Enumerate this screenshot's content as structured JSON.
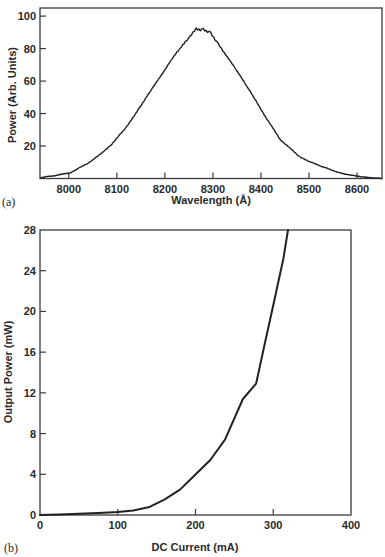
{
  "chart_data": [
    {
      "panel": "(a)",
      "type": "line",
      "title": "",
      "xlabel": "Wavelength (Å)",
      "ylabel": "Power (Arb. Units)",
      "xlim": [
        7940,
        8652
      ],
      "ylim": [
        0,
        105
      ],
      "x_ticks": [
        8000,
        8100,
        8200,
        8300,
        8400,
        8500,
        8600
      ],
      "y_ticks": [
        20,
        40,
        60,
        80,
        100
      ],
      "grid": false,
      "legend": null,
      "series": [
        {
          "name": "Emission spectrum",
          "x": [
            7940,
            7970,
            8002,
            8044,
            8086,
            8121,
            8148,
            8175,
            8200,
            8225,
            8252,
            8265,
            8280,
            8295,
            8311,
            8346,
            8377,
            8403,
            8440,
            8482,
            8523,
            8565,
            8607,
            8638,
            8652
          ],
          "y": [
            0.5,
            1.8,
            3.4,
            10,
            20,
            32,
            44,
            56,
            67,
            78,
            87,
            92,
            92,
            90,
            83,
            68,
            54,
            41,
            24,
            13,
            7.7,
            3.4,
            1,
            0.3,
            0
          ]
        }
      ]
    },
    {
      "panel": "(b)",
      "type": "line",
      "title": "",
      "xlabel": "DC Current (mA)",
      "ylabel": "Output Power (mW)",
      "xlim": [
        0,
        400
      ],
      "ylim": [
        0,
        28
      ],
      "x_ticks": [
        0,
        100,
        200,
        300,
        400
      ],
      "y_ticks": [
        0,
        4,
        8,
        12,
        16,
        20,
        24,
        28
      ],
      "grid": false,
      "legend": null,
      "series": [
        {
          "name": "L-I curve",
          "x": [
            0,
            25,
            50,
            75,
            100,
            120,
            141,
            160,
            180,
            199,
            219,
            238,
            261,
            278,
            289,
            302,
            313,
            319
          ],
          "y": [
            0,
            0.05,
            0.12,
            0.2,
            0.3,
            0.45,
            0.8,
            1.5,
            2.5,
            3.9,
            5.4,
            7.4,
            11.4,
            12.9,
            16.8,
            21.3,
            25.2,
            28
          ]
        }
      ]
    }
  ],
  "labels": {
    "panel_a": "(a)",
    "panel_b": "(b)"
  }
}
